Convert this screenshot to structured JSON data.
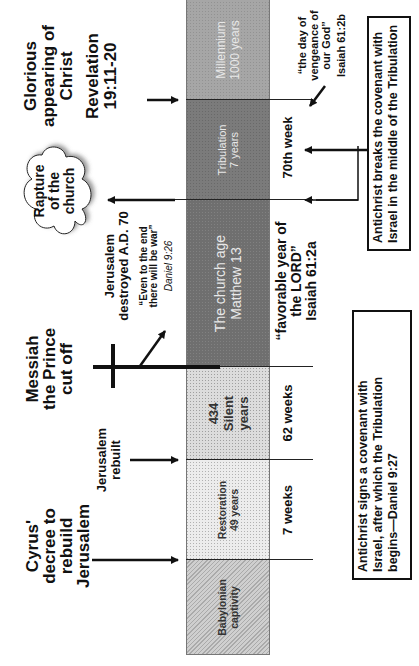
{
  "timeline": {
    "segments": [
      {
        "id": "babylonian",
        "line1": "Babylonian",
        "line2": "captivity",
        "line3": ""
      },
      {
        "id": "restoration",
        "line1": "Restoration",
        "line2": "49 years",
        "line3": ""
      },
      {
        "id": "silent",
        "line1": "434",
        "line2": "Silent",
        "line3": "years"
      },
      {
        "id": "church",
        "line1": "The church age",
        "line2": "Matthew 13",
        "line3": ""
      },
      {
        "id": "tribulation",
        "line1": "Tribulation",
        "line2": "7 years",
        "line3": ""
      },
      {
        "id": "millennium",
        "line1": "Millennium",
        "line2": "1000 years",
        "line3": ""
      }
    ],
    "weeks": {
      "w7": "7 weeks",
      "w62": "62 weeks",
      "w70": "70th week"
    }
  },
  "events": {
    "cyrus": {
      "l1": "Cyrus'",
      "l2": "decree to",
      "l3": "rebuild",
      "l4": "Jerusalem"
    },
    "rebuilt": {
      "l1": "Jerusalem",
      "l2": "rebuilt"
    },
    "messiah": {
      "l1": "Messiah",
      "l2": "the Prince",
      "l3": "cut off"
    },
    "destroyed": {
      "l1": "Jerusalem",
      "l2": "destroyed A.D. 70",
      "q1": "“Even to the end",
      "q2": "there will be war”",
      "ref": "Daniel 9:26"
    },
    "rapture": {
      "l1": "Rapture",
      "l2": "of the",
      "l3": "church"
    },
    "glorious": {
      "l1": "Glorious",
      "l2": "appearing of",
      "l3": "Christ",
      "ref1": "Revelation",
      "ref2": "19:11-20"
    }
  },
  "quotes": {
    "favorable": {
      "l1": "“favorable year of",
      "l2": "the LORD”",
      "ref": "Isaiah  61:2a"
    },
    "vengeance": {
      "l1": "“the day of",
      "l2": "vengeance of",
      "l3": "our God”",
      "ref": "Isaiah 61:2b"
    }
  },
  "boxes": {
    "signs": {
      "l1": "Antichrist signs a covenant with",
      "l2": "Israel, after which the Tribulation",
      "l3": "begins—Daniel 9:27"
    },
    "breaks": {
      "l1": "Antichrist breaks the covenant with",
      "l2": "Israel in the middle of the Tribulation"
    }
  }
}
